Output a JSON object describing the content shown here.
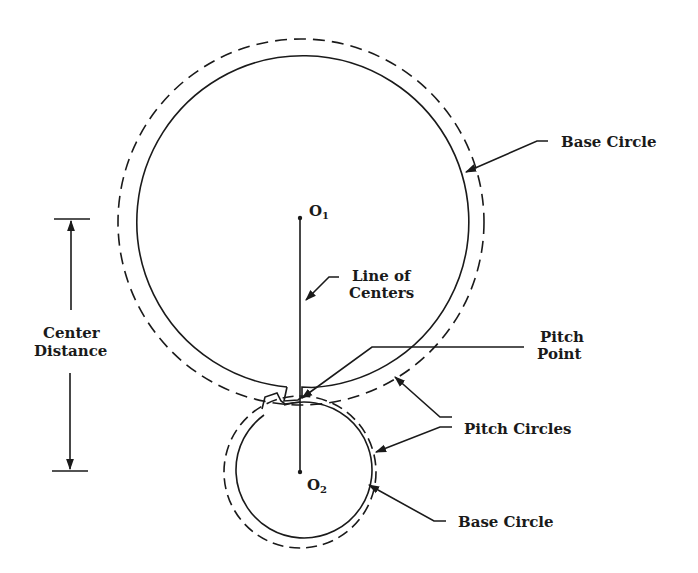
{
  "diagram": {
    "colors": {
      "line": "#1a1a1a",
      "background": "#ffffff"
    },
    "labels": {
      "base_circle_top": "Base Circle",
      "line_of_centers_1": "Line of",
      "line_of_centers_2": "Centers",
      "center_distance_1": "Center",
      "center_distance_2": "Distance",
      "pitch_point_1": "Pitch",
      "pitch_point_2": "Point",
      "pitch_circles": "Pitch Circles",
      "base_circle_bottom": "Base Circle",
      "o1_letter": "O",
      "o1_sub": "1",
      "o2_letter": "O",
      "o2_sub": "2"
    },
    "gears": [
      {
        "name": "large gear",
        "center": [
          301,
          222
        ],
        "base_radius": 166,
        "pitch_radius": 183
      },
      {
        "name": "small gear",
        "center": [
          300,
          472
        ],
        "base_radius": 68,
        "pitch_radius": 76
      }
    ]
  }
}
